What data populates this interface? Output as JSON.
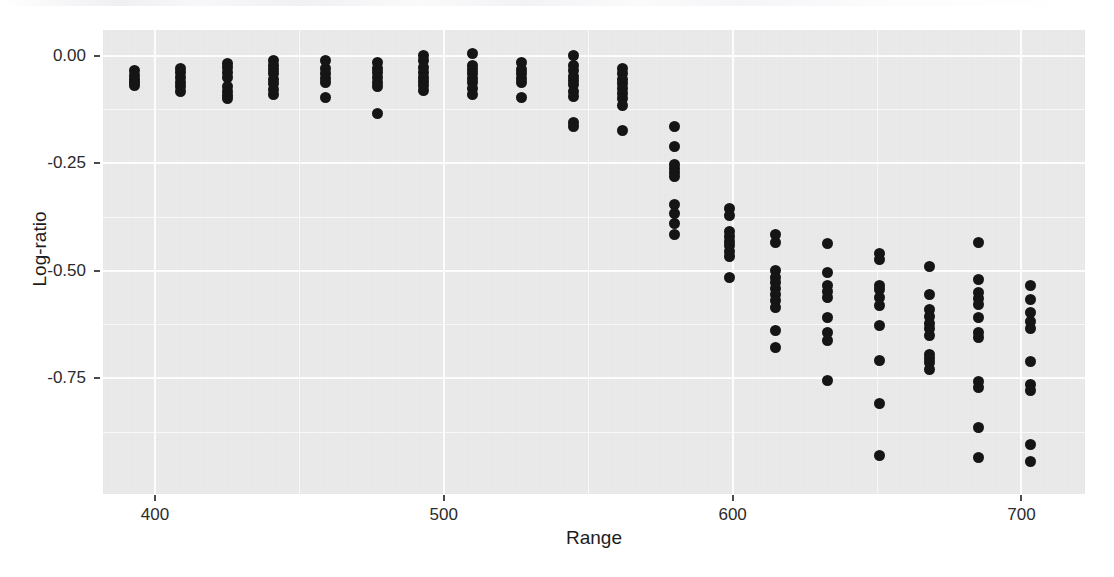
{
  "figure": {
    "background_color": "#ffffff",
    "panel_color": "#ebebeb",
    "grid_color": "#ffffff",
    "point_color": "#151515"
  },
  "chart_data": {
    "type": "scatter",
    "title": "",
    "xlabel": "Range",
    "ylabel": "Log-ratio",
    "xlim": [
      382,
      722
    ],
    "ylim": [
      -1.02,
      0.06
    ],
    "xticks": [
      400,
      500,
      600,
      700
    ],
    "xticklabels": [
      "400",
      "500",
      "600",
      "700"
    ],
    "yticks": [
      0.0,
      -0.25,
      -0.5,
      -0.75
    ],
    "yticklabels": [
      "0.00",
      "-0.25",
      "-0.50",
      "-0.75"
    ],
    "grid": true,
    "grid_minor": true,
    "legend": "none",
    "marker": "filled-circle",
    "series": [
      {
        "name": "Log-ratio vs Range",
        "points": [
          [
            393,
            -0.035
          ],
          [
            393,
            -0.045
          ],
          [
            393,
            -0.055
          ],
          [
            393,
            -0.062
          ],
          [
            393,
            -0.07
          ],
          [
            409,
            -0.03
          ],
          [
            409,
            -0.04
          ],
          [
            409,
            -0.05
          ],
          [
            409,
            -0.062
          ],
          [
            409,
            -0.072
          ],
          [
            409,
            -0.082
          ],
          [
            425,
            -0.018
          ],
          [
            425,
            -0.028
          ],
          [
            425,
            -0.038
          ],
          [
            425,
            -0.05
          ],
          [
            425,
            -0.072
          ],
          [
            425,
            -0.082
          ],
          [
            425,
            -0.092
          ],
          [
            425,
            -0.1
          ],
          [
            441,
            -0.012
          ],
          [
            441,
            -0.022
          ],
          [
            441,
            -0.032
          ],
          [
            441,
            -0.042
          ],
          [
            441,
            -0.055
          ],
          [
            441,
            -0.065
          ],
          [
            441,
            -0.078
          ],
          [
            441,
            -0.09
          ],
          [
            459,
            -0.012
          ],
          [
            459,
            -0.03
          ],
          [
            459,
            -0.042
          ],
          [
            459,
            -0.052
          ],
          [
            459,
            -0.062
          ],
          [
            459,
            -0.098
          ],
          [
            477,
            -0.015
          ],
          [
            477,
            -0.03
          ],
          [
            477,
            -0.04
          ],
          [
            477,
            -0.05
          ],
          [
            477,
            -0.062
          ],
          [
            477,
            -0.072
          ],
          [
            477,
            -0.135
          ],
          [
            493,
            0.0
          ],
          [
            493,
            -0.012
          ],
          [
            493,
            -0.028
          ],
          [
            493,
            -0.04
          ],
          [
            493,
            -0.05
          ],
          [
            493,
            -0.06
          ],
          [
            493,
            -0.07
          ],
          [
            493,
            -0.08
          ],
          [
            510,
            0.005
          ],
          [
            510,
            -0.022
          ],
          [
            510,
            -0.032
          ],
          [
            510,
            -0.042
          ],
          [
            510,
            -0.052
          ],
          [
            510,
            -0.062
          ],
          [
            510,
            -0.075
          ],
          [
            510,
            -0.09
          ],
          [
            527,
            -0.015
          ],
          [
            527,
            -0.032
          ],
          [
            527,
            -0.042
          ],
          [
            527,
            -0.052
          ],
          [
            527,
            -0.062
          ],
          [
            527,
            -0.098
          ],
          [
            545,
            0.0
          ],
          [
            545,
            -0.022
          ],
          [
            545,
            -0.035
          ],
          [
            545,
            -0.048
          ],
          [
            545,
            -0.058
          ],
          [
            545,
            -0.068
          ],
          [
            545,
            -0.082
          ],
          [
            545,
            -0.095
          ],
          [
            545,
            -0.155
          ],
          [
            545,
            -0.165
          ],
          [
            562,
            -0.03
          ],
          [
            562,
            -0.042
          ],
          [
            562,
            -0.055
          ],
          [
            562,
            -0.065
          ],
          [
            562,
            -0.075
          ],
          [
            562,
            -0.088
          ],
          [
            562,
            -0.1
          ],
          [
            562,
            -0.115
          ],
          [
            562,
            -0.175
          ],
          [
            580,
            -0.165
          ],
          [
            580,
            -0.21
          ],
          [
            580,
            -0.252
          ],
          [
            580,
            -0.262
          ],
          [
            580,
            -0.272
          ],
          [
            580,
            -0.282
          ],
          [
            580,
            -0.345
          ],
          [
            580,
            -0.368
          ],
          [
            580,
            -0.39
          ],
          [
            580,
            -0.415
          ],
          [
            599,
            -0.355
          ],
          [
            599,
            -0.372
          ],
          [
            599,
            -0.41
          ],
          [
            599,
            -0.42
          ],
          [
            599,
            -0.432
          ],
          [
            599,
            -0.442
          ],
          [
            599,
            -0.455
          ],
          [
            599,
            -0.468
          ],
          [
            599,
            -0.515
          ],
          [
            615,
            -0.415
          ],
          [
            615,
            -0.435
          ],
          [
            615,
            -0.5
          ],
          [
            615,
            -0.515
          ],
          [
            615,
            -0.528
          ],
          [
            615,
            -0.542
          ],
          [
            615,
            -0.555
          ],
          [
            615,
            -0.57
          ],
          [
            615,
            -0.585
          ],
          [
            615,
            -0.64
          ],
          [
            615,
            -0.68
          ],
          [
            633,
            -0.438
          ],
          [
            633,
            -0.505
          ],
          [
            633,
            -0.535
          ],
          [
            633,
            -0.548
          ],
          [
            633,
            -0.562
          ],
          [
            633,
            -0.61
          ],
          [
            633,
            -0.645
          ],
          [
            633,
            -0.662
          ],
          [
            633,
            -0.755
          ],
          [
            651,
            -0.46
          ],
          [
            651,
            -0.475
          ],
          [
            651,
            -0.535
          ],
          [
            651,
            -0.545
          ],
          [
            651,
            -0.562
          ],
          [
            651,
            -0.582
          ],
          [
            651,
            -0.628
          ],
          [
            651,
            -0.71
          ],
          [
            651,
            -0.81
          ],
          [
            651,
            -0.93
          ],
          [
            668,
            -0.49
          ],
          [
            668,
            -0.555
          ],
          [
            668,
            -0.59
          ],
          [
            668,
            -0.608
          ],
          [
            668,
            -0.622
          ],
          [
            668,
            -0.635
          ],
          [
            668,
            -0.652
          ],
          [
            668,
            -0.695
          ],
          [
            668,
            -0.705
          ],
          [
            668,
            -0.715
          ],
          [
            668,
            -0.73
          ],
          [
            685,
            -0.435
          ],
          [
            685,
            -0.52
          ],
          [
            685,
            -0.552
          ],
          [
            685,
            -0.565
          ],
          [
            685,
            -0.578
          ],
          [
            685,
            -0.61
          ],
          [
            685,
            -0.645
          ],
          [
            685,
            -0.655
          ],
          [
            685,
            -0.758
          ],
          [
            685,
            -0.772
          ],
          [
            685,
            -0.865
          ],
          [
            685,
            -0.935
          ],
          [
            703,
            -0.535
          ],
          [
            703,
            -0.568
          ],
          [
            703,
            -0.598
          ],
          [
            703,
            -0.618
          ],
          [
            703,
            -0.635
          ],
          [
            703,
            -0.712
          ],
          [
            703,
            -0.765
          ],
          [
            703,
            -0.778
          ],
          [
            703,
            -0.905
          ],
          [
            703,
            -0.945
          ]
        ]
      }
    ]
  }
}
